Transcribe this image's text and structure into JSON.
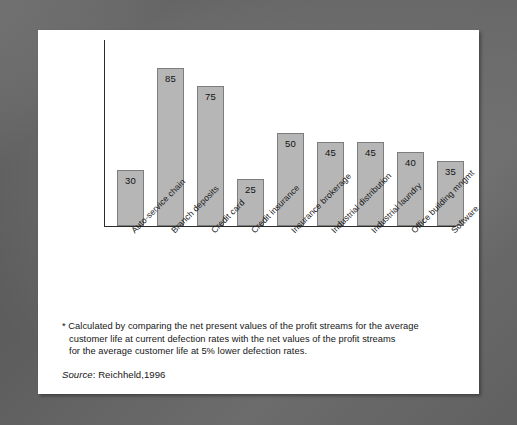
{
  "chart_data": {
    "type": "bar",
    "title": "",
    "subtitle": "",
    "xlabel": "",
    "ylabel": "",
    "grid": false,
    "legend": false,
    "ylim": [
      0,
      100
    ],
    "categories": [
      "Auto-service chain",
      "Branch deposits",
      "Credit card",
      "Credit insurance",
      "Insurance brokerage",
      "Industrial distribution",
      "Industrial laundry",
      "Office building mngmt",
      "Software"
    ],
    "values": [
      30,
      85,
      75,
      25,
      50,
      45,
      45,
      40,
      35
    ],
    "value_labels": [
      "30",
      "85",
      "75",
      "25",
      "50",
      "45",
      "45",
      "40",
      "35"
    ],
    "bar_color": "#b6b6b6",
    "bar_border_color": "#7d7d7d",
    "axis_color": "#2b2b2b"
  },
  "notes": {
    "line1": "* Calculated by comparing the net present values of the profit streams for the average",
    "line2": "customer life at current defection rates with the net values of the profit streams",
    "line3": "for the average customer life at 5% lower defection rates."
  },
  "source": {
    "label": "Source",
    "text": ": Reichheld,1996"
  }
}
